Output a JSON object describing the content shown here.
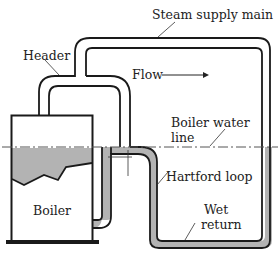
{
  "diagram": {
    "labels": {
      "steam_main": "Steam supply main",
      "header": "Header",
      "flow": "Flow",
      "water_line_1": "Boiler water",
      "water_line_2": "line",
      "hartford": "Hartford loop",
      "boiler": "Boiler",
      "wet_1": "Wet",
      "wet_2": "return"
    },
    "colors": {
      "pipe_stroke": "#1a1a1a",
      "water_fill": "#b3b3b3",
      "water_line": "#555555",
      "background": "#ffffff"
    }
  }
}
